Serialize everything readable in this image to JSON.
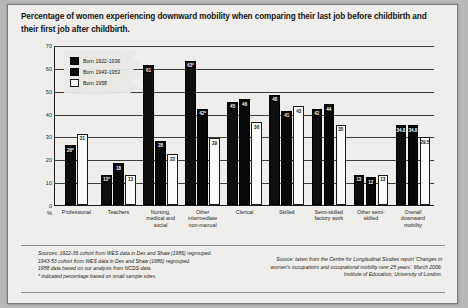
{
  "figure": {
    "title": "Percentage of women experiencing downward mobility when comparing their last job before childbirth and their first job after childbirth.",
    "notes_left": "Sources: 1922-36 cohort from WES data in Dex and Shaw (1986) regrouped.\n1943-53 cohort from WES data in Dex and Shaw (1986) regrouped.\n1958 data based on our analysis from NCDS data.\n* indicated percentage based on small sample sizes.",
    "notes_right": "Source: taken from the Centre for Longitudinal Studies report 'Changes in women's occupations and occupational mobility over 25 years', March 2006: Institute of Education, University of London."
  },
  "chart_data": {
    "type": "bar",
    "title": "Percentage of women experiencing downward mobility when comparing their last job before childbirth and their first job after childbirth.",
    "xlabel": "",
    "ylabel": "%",
    "ylim": [
      0,
      70
    ],
    "yticks": [
      "0",
      "10",
      "20",
      "30",
      "40",
      "50",
      "60",
      "70"
    ],
    "y_unit_label": "%",
    "grid": true,
    "legend_position": "top-left",
    "categories": [
      "Professional",
      "Teachers",
      "Nursing, medical and social",
      "Other intermediate non-manual",
      "Clerical",
      "Skilled",
      "Semi-skilled factory work",
      "Other semi-skilled",
      "Overall downward mobility"
    ],
    "series": [
      {
        "name": "Born 1922-1936",
        "color": "#0d0d0d",
        "values": [
          26,
          13,
          61,
          63,
          45,
          48,
          42,
          13,
          34.8
        ],
        "labels": [
          "26*",
          "13*",
          "61",
          "63*",
          "45",
          "48",
          "42",
          "13",
          "34.8"
        ]
      },
      {
        "name": "Born 1943-1953",
        "color": "#080808",
        "values": [
          null,
          18,
          28,
          42,
          46,
          41,
          44,
          12,
          34.8
        ],
        "labels": [
          "",
          "18",
          "28",
          "42*",
          "46",
          "41",
          "44",
          "12",
          "34.8"
        ]
      },
      {
        "name": "Born 1958",
        "color": "#ffffff",
        "values": [
          31,
          13,
          22,
          29,
          36,
          43,
          35,
          13,
          29.5
        ],
        "labels": [
          "31",
          "13",
          "22",
          "29",
          "36",
          "43",
          "35",
          "13",
          "29.5"
        ]
      }
    ]
  }
}
